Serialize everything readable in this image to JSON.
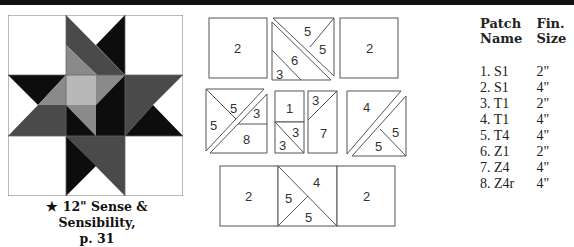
{
  "caption": {
    "line1": "★ 12\" Sense & Sensibility,",
    "line2": "p. 31"
  },
  "colors": {
    "black": "#0d0d0d",
    "dark_gray": "#4a4a4a",
    "mid_gray": "#8a8a8a",
    "light_gray": "#b8b8b8",
    "white": "#ffffff",
    "line": "#555555"
  },
  "diagram": {
    "top_row": {
      "left_square": "2",
      "middle": [
        "5",
        "5",
        "6",
        "3"
      ],
      "right_square": "2"
    },
    "middle_row": {
      "unit_a": [
        "5",
        "5",
        "3",
        "8"
      ],
      "unit_b": [
        "1",
        "3",
        "3"
      ],
      "unit_c": [
        "3",
        "7"
      ],
      "unit_d": [
        "4",
        "5",
        "5"
      ]
    },
    "bottom_row": {
      "left_square": "2",
      "middle": [
        "4",
        "5",
        "5"
      ],
      "right_square": "2"
    }
  },
  "table": {
    "headers": {
      "col1_line1": "Patch",
      "col1_line2": "Name",
      "col2_line1": "Fin.",
      "col2_line2": "Size"
    },
    "rows": [
      {
        "name": "1. S1",
        "size": "2\""
      },
      {
        "name": "2. S1",
        "size": "4\""
      },
      {
        "name": "3. T1",
        "size": "2\""
      },
      {
        "name": "4. T1",
        "size": "4\""
      },
      {
        "name": "5. T4",
        "size": "4\""
      },
      {
        "name": "6. Z1",
        "size": "2\""
      },
      {
        "name": "7. Z4",
        "size": "4\""
      },
      {
        "name": "8. Z4r",
        "size": "4\""
      }
    ]
  }
}
